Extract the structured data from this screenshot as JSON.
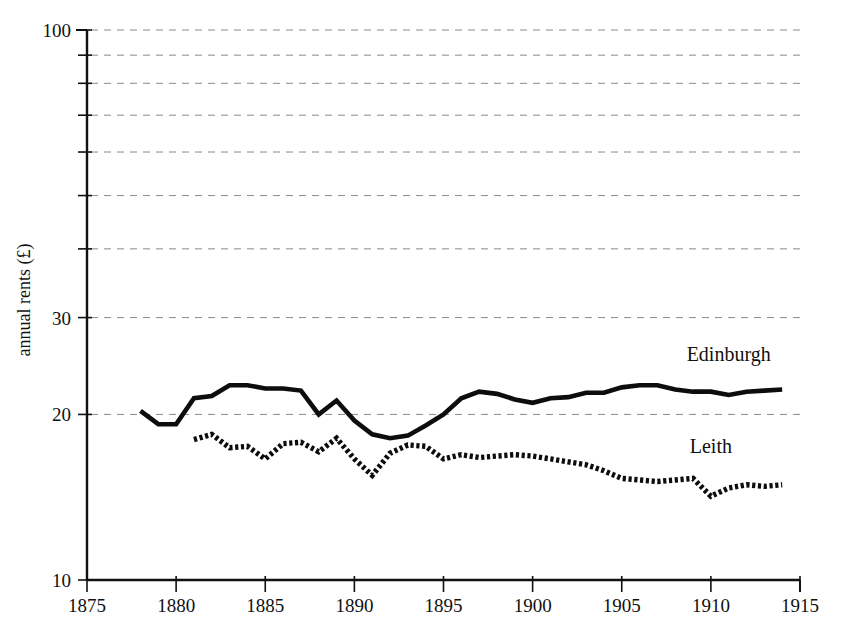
{
  "chart_data": {
    "type": "line",
    "title": "",
    "xlabel": "",
    "ylabel": "annual rents (£)",
    "y_scale": "log",
    "ylim": [
      10,
      100
    ],
    "xlim": [
      1875,
      1915
    ],
    "grid": true,
    "grid_axis": "y",
    "legend_position": "inline-annotations",
    "y_tick_labels": [
      "100",
      "30",
      "20",
      "10"
    ],
    "y_tick_values": [
      100,
      90,
      80,
      70,
      60,
      50,
      40,
      30,
      20,
      10
    ],
    "x_tick_labels": [
      "1875",
      "1880",
      "1885",
      "1890",
      "1895",
      "1900",
      "1905",
      "1910",
      "1915"
    ],
    "x_tick_values": [
      1875,
      1880,
      1885,
      1890,
      1895,
      1900,
      1905,
      1910,
      1915
    ],
    "series": [
      {
        "name": "Edinburgh",
        "style": "solid",
        "x": [
          1878,
          1879,
          1880,
          1881,
          1882,
          1883,
          1884,
          1885,
          1886,
          1887,
          1888,
          1889,
          1890,
          1891,
          1892,
          1893,
          1894,
          1895,
          1896,
          1897,
          1898,
          1899,
          1900,
          1901,
          1902,
          1903,
          1904,
          1905,
          1906,
          1907,
          1908,
          1909,
          1910,
          1911,
          1912,
          1913,
          1914
        ],
        "values": [
          20.3,
          19.2,
          19.2,
          21.4,
          21.6,
          22.6,
          22.6,
          22.3,
          22.3,
          22.1,
          20.0,
          21.2,
          19.5,
          18.4,
          18.1,
          18.3,
          19.1,
          20.0,
          21.4,
          22.0,
          21.8,
          21.3,
          21.0,
          21.4,
          21.5,
          21.9,
          21.9,
          22.4,
          22.6,
          22.6,
          22.2,
          22.0,
          22.0,
          21.7,
          22.0,
          22.1,
          22.2
        ]
      },
      {
        "name": "Leith",
        "style": "dotted",
        "x": [
          1881,
          1882,
          1883,
          1884,
          1885,
          1886,
          1887,
          1888,
          1889,
          1890,
          1891,
          1892,
          1893,
          1894,
          1895,
          1896,
          1897,
          1898,
          1899,
          1900,
          1901,
          1902,
          1903,
          1904,
          1905,
          1906,
          1907,
          1908,
          1909,
          1910,
          1911,
          1912,
          1913,
          1914
        ],
        "values": [
          18.0,
          18.4,
          17.4,
          17.5,
          16.6,
          17.7,
          17.8,
          17.1,
          18.1,
          16.6,
          15.5,
          17.0,
          17.6,
          17.5,
          16.6,
          16.9,
          16.7,
          16.8,
          16.9,
          16.8,
          16.6,
          16.4,
          16.2,
          15.8,
          15.3,
          15.2,
          15.1,
          15.2,
          15.3,
          14.2,
          14.7,
          14.9,
          14.8,
          14.9
        ]
      }
    ],
    "annotations": [
      {
        "text": "Edinburgh",
        "x": 1911,
        "y": 25.0
      },
      {
        "text": "Leith",
        "x": 1910,
        "y": 17.0
      }
    ]
  },
  "axis": {
    "y_label": "annual rents (£)"
  }
}
